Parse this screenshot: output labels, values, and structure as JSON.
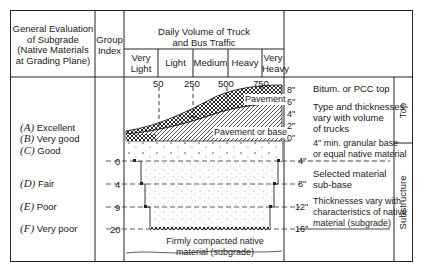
{
  "header": {
    "evaluation_title": [
      "General Evaluation",
      "of Subgrade",
      "(Native Materials",
      "at Grading Plane)"
    ],
    "group_index_title": [
      "Group",
      "Index"
    ],
    "traffic_title": [
      "Daily Volume of Truck",
      "and Bus Traffic"
    ],
    "traffic_columns": [
      {
        "label": [
          "Very",
          "Light"
        ]
      },
      {
        "label": [
          "Light"
        ]
      },
      {
        "label": [
          "Medium"
        ]
      },
      {
        "label": [
          "Heavy"
        ]
      },
      {
        "label": [
          "Very",
          "Heavy"
        ]
      }
    ]
  },
  "traffic_markers": [
    "50",
    "250",
    "500",
    "750"
  ],
  "subgrade_grades": [
    {
      "letter": "(A)",
      "label": "Excellent"
    },
    {
      "letter": "(B)",
      "label": "Very good"
    },
    {
      "letter": "(C)",
      "label": "Good"
    },
    {
      "letter": "(D)",
      "label": "Fair"
    },
    {
      "letter": "(E)",
      "label": "Poor"
    },
    {
      "letter": "(F)",
      "label": "Very poor"
    }
  ],
  "group_index_values": [
    "0",
    "4",
    "9",
    "20"
  ],
  "diagram_labels": {
    "pavement": "Pavement",
    "pavement_or_base": "Pavement or base",
    "compacted": [
      "Firmly compacted native",
      "material (subgrade)"
    ]
  },
  "thickness_scale_top": [
    "8\"",
    "6\"",
    "4\"",
    "2\"",
    "0\""
  ],
  "thickness_scale_bottom": [
    "4\"",
    "8\"",
    "12\"",
    "16\""
  ],
  "descriptions": {
    "bitum": "Bitum. or PCC top",
    "type_thickness": [
      "Type and thicknesses",
      "vary with volume",
      "of trucks"
    ],
    "granular": [
      "4\" min. granular base",
      "or equal native material"
    ],
    "selected": [
      "Selected material",
      "sub-base"
    ],
    "thickness_native": [
      "Thicknesses vary with",
      "characteristics of native",
      "material (subgrade)"
    ]
  },
  "side_labels": {
    "top": "Top",
    "substructure": "Substructure"
  }
}
